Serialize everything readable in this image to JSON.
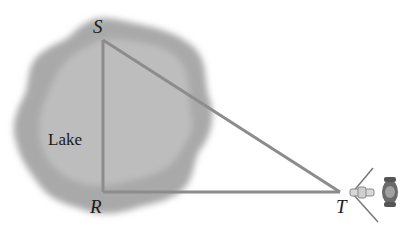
{
  "diagram": {
    "type": "geometry-triangle",
    "labels": {
      "s": "S",
      "r": "R",
      "t": "T",
      "lake": "Lake"
    },
    "points": {
      "S": [
        103,
        40
      ],
      "R": [
        103,
        192
      ],
      "T": [
        340,
        192
      ]
    },
    "colors": {
      "lake_outer": "#a8a8a8",
      "lake_inner": "#bcbcbc",
      "lines": "#8c8c8c",
      "text": "#1a1a1a"
    },
    "objects": [
      {
        "name": "surveyor-transit-instrument",
        "at": "T"
      }
    ]
  }
}
